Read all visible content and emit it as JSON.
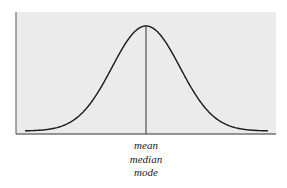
{
  "chart_data": {
    "type": "line",
    "title": "",
    "xlabel": "",
    "ylabel": "",
    "center_line_labels": [
      "mean",
      "median",
      "mode"
    ],
    "axes": {
      "x_ticks": [],
      "y_ticks": [],
      "grid": false
    },
    "legend": null,
    "colors": {
      "plot_background": "#ebebeb",
      "curve": "#1a1a1a",
      "axis": "#333333"
    }
  },
  "labels": {
    "mean": "mean",
    "median": "median",
    "mode": "mode"
  }
}
